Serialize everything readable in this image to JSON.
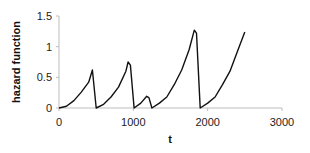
{
  "chart_data": {
    "type": "line",
    "title": "",
    "xlabel": "t",
    "ylabel": "hazard function",
    "xlim": [
      0,
      3000
    ],
    "ylim": [
      0,
      1.5
    ],
    "xticks": [
      0,
      1000,
      2000,
      3000
    ],
    "xtick_labels": [
      "0",
      "1000",
      "2000",
      "3000"
    ],
    "yticks": [
      0,
      0.5,
      1,
      1.5
    ],
    "ytick_labels": [
      "0",
      "0.5",
      "1",
      "1.5"
    ],
    "grid": false,
    "legend": null,
    "series": [
      {
        "name": "hazard function",
        "color": "#111111",
        "points": [
          [
            0,
            0
          ],
          [
            100,
            0.03
          ],
          [
            200,
            0.12
          ],
          [
            300,
            0.26
          ],
          [
            400,
            0.42
          ],
          [
            450,
            0.62
          ],
          [
            500,
            0
          ],
          [
            600,
            0.06
          ],
          [
            700,
            0.18
          ],
          [
            800,
            0.34
          ],
          [
            900,
            0.6
          ],
          [
            930,
            0.75
          ],
          [
            960,
            0.7
          ],
          [
            1010,
            0
          ],
          [
            1100,
            0.08
          ],
          [
            1180,
            0.19
          ],
          [
            1210,
            0.17
          ],
          [
            1250,
            0
          ],
          [
            1350,
            0.08
          ],
          [
            1450,
            0.18
          ],
          [
            1550,
            0.38
          ],
          [
            1650,
            0.62
          ],
          [
            1750,
            0.95
          ],
          [
            1820,
            1.27
          ],
          [
            1850,
            1.22
          ],
          [
            1900,
            0
          ],
          [
            2000,
            0.08
          ],
          [
            2100,
            0.18
          ],
          [
            2200,
            0.38
          ],
          [
            2300,
            0.6
          ],
          [
            2400,
            0.92
          ],
          [
            2500,
            1.24
          ]
        ]
      }
    ]
  }
}
